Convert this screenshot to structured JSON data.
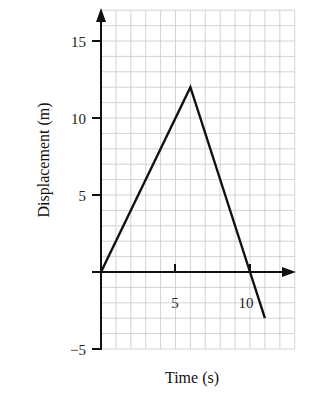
{
  "chart_data": {
    "type": "line",
    "title": "",
    "xlabel": "Time (s)",
    "ylabel": "Displacement (m)",
    "x_ticks": [
      5,
      10
    ],
    "y_ticks": [
      -5,
      5,
      10,
      15
    ],
    "xlim": [
      0,
      13
    ],
    "ylim": [
      -5,
      17
    ],
    "grid": true,
    "grid_spacing": 1,
    "series": [
      {
        "name": "displacement",
        "x": [
          0,
          6,
          10,
          11
        ],
        "y": [
          0,
          12,
          0,
          -3
        ]
      }
    ]
  },
  "labels": {
    "xlabel": "Time (s)",
    "ylabel": "Displacement (m)",
    "y15": "15",
    "y10": "10",
    "y5": "5",
    "yneg5": "−5",
    "x5": "5",
    "x10": "10"
  }
}
